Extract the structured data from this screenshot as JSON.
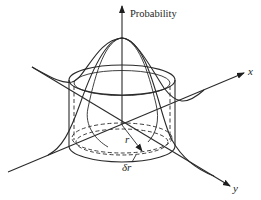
{
  "figure": {
    "labels": {
      "vertical_axis": "Probability",
      "x_axis": "x",
      "y_axis": "y",
      "radius": "r",
      "thickness": "δr"
    },
    "colors": {
      "line": "#2a2a2a",
      "background": "#ffffff"
    }
  }
}
